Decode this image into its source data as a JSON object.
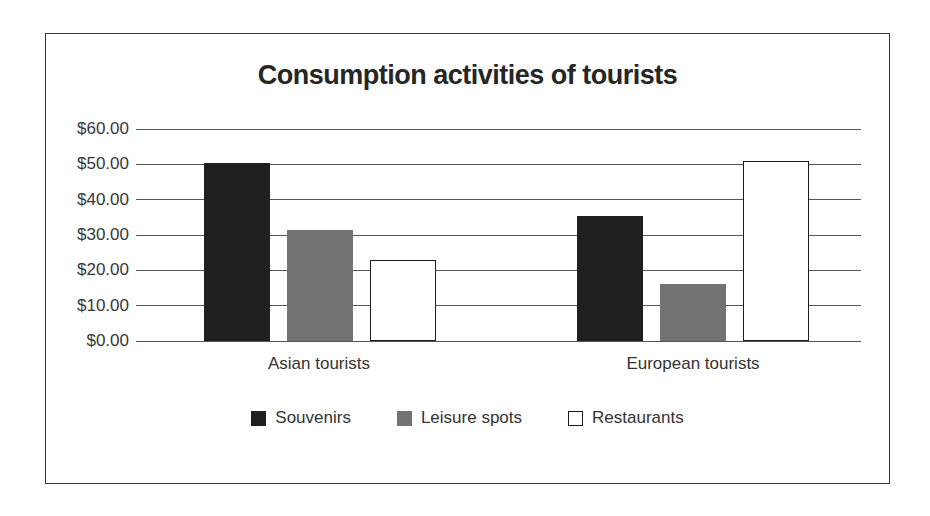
{
  "frame": {
    "background": "#ffffff",
    "border_color": "#3a3a3a"
  },
  "chart_data": {
    "type": "bar",
    "title": "Consumption activities of tourists",
    "categories": [
      "Asian tourists",
      "European tourists"
    ],
    "series": [
      {
        "name": "Souvenirs",
        "color": "#1f1f1f",
        "values": [
          50.5,
          35.5
        ]
      },
      {
        "name": "Leisure spots",
        "color": "#737373",
        "values": [
          31.5,
          16.0
        ]
      },
      {
        "name": "Restaurants",
        "color": "#ffffff",
        "values": [
          23.0,
          51.0
        ]
      }
    ],
    "y_ticks": [
      {
        "value": 60,
        "label": "$60.00"
      },
      {
        "value": 50,
        "label": "$50.00"
      },
      {
        "value": 40,
        "label": "$40.00"
      },
      {
        "value": 30,
        "label": "$30.00"
      },
      {
        "value": 20,
        "label": "$20.00"
      },
      {
        "value": 10,
        "label": "$10.00"
      },
      {
        "value": 0,
        "label": "$0.00"
      }
    ],
    "ylim": [
      0,
      60
    ],
    "xlabel": "",
    "ylabel": "",
    "grid": true,
    "legend_position": "bottom",
    "text_color": "#333333",
    "gridline_color": "#555555"
  }
}
